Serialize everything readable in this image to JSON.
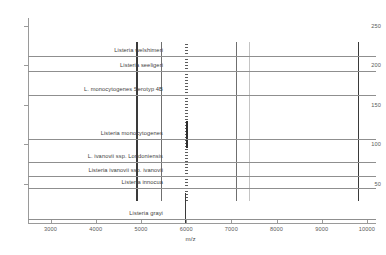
{
  "chart_data": {
    "type": "line",
    "title": "",
    "xlabel": "m/z",
    "ylabel": "",
    "xlim": [
      2500,
      10200
    ],
    "ylim": [
      0,
      260
    ],
    "grid": false,
    "legend": "none",
    "x_ticks": [
      3000,
      4000,
      5000,
      6000,
      7000,
      8000,
      9000,
      10000
    ],
    "y_ticks": [
      50,
      100,
      150,
      200,
      250
    ],
    "series": [
      {
        "name": "Listeria welshimeri",
        "baseline": 212,
        "label_x": 163
      },
      {
        "name": "Listeria seeligeri",
        "baseline": 193,
        "label_x": 163
      },
      {
        "name": "L. monocytogenes Serotyp 4B",
        "baseline": 162,
        "label_x": 163
      },
      {
        "name": "Listeria monocytogenes",
        "baseline": 107,
        "label_x": 163
      },
      {
        "name": "L. ivanovii ssp. Londoniensis",
        "baseline": 78,
        "label_x": 163
      },
      {
        "name": "Listeria ivanovii ssp. ivanovii",
        "baseline": 60,
        "label_x": 163
      },
      {
        "name": "Listeria innocua",
        "baseline": 44,
        "label_x": 163
      },
      {
        "name": "Listeria grayi",
        "baseline": 5,
        "label_x": 163
      }
    ],
    "peaks": [
      {
        "mz": 4900,
        "intensity": "strong"
      },
      {
        "mz": 5450,
        "intensity": "medium"
      },
      {
        "mz": 6000,
        "intensity": "cluster"
      },
      {
        "mz": 7100,
        "intensity": "medium"
      },
      {
        "mz": 7400,
        "intensity": "faint"
      },
      {
        "mz": 9800,
        "intensity": "strong"
      },
      {
        "mz": 6000,
        "intensity": "grayi-peak"
      }
    ],
    "annotations": [
      "Gel-view MALDI-TOF mass spectra of eight Listeria species",
      "Dense peak cluster centred near m/z 6000"
    ]
  }
}
